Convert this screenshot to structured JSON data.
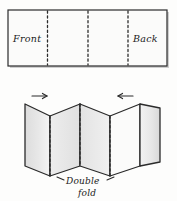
{
  "figure": {
    "background_color": "#fdfdfc",
    "ink_color": "#1a1a1a",
    "panel_fill": "#fbfbfa",
    "panel_shaded_fill": "#e4e4e4",
    "panel_shaded_fill_light": "#efefef"
  },
  "flat_sheet": {
    "label_front": "Front",
    "label_back": "Back",
    "fold_line_style": "dotted",
    "fold_line_count": 3
  },
  "folded_sheet": {
    "arrow_left": "→",
    "arrow_right": "←",
    "caption_line1": "Double",
    "caption_line2": "fold"
  }
}
